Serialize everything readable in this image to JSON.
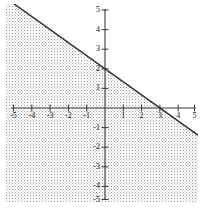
{
  "chart_data": {
    "type": "line",
    "title": "",
    "xlabel": "",
    "ylabel": "",
    "xlim": [
      -5,
      5
    ],
    "ylim": [
      -5,
      5
    ],
    "grid": false,
    "legend": null,
    "x_ticks": [
      -5,
      -4,
      -3,
      -2,
      -1,
      1,
      2,
      3,
      4,
      5
    ],
    "y_ticks": [
      -5,
      -4,
      -3,
      -2,
      -1,
      1,
      2,
      3,
      4,
      5
    ],
    "x_tick_labels": [
      "-5",
      "-4",
      "-3",
      "-2",
      "-1",
      "1",
      "2",
      "3",
      "4",
      "5"
    ],
    "y_tick_labels": [
      "-5",
      "-4",
      "-3",
      "-2",
      "-1",
      "1",
      "2",
      "3",
      "4",
      "5"
    ],
    "series": [
      {
        "name": "boundary-line",
        "type": "line",
        "style": "solid",
        "color": "#2b2b2b",
        "slope": -0.6667,
        "intercept": 2,
        "x_intercept": 3,
        "y_intercept": 2,
        "points": [
          [
            -5.1,
            5.4
          ],
          [
            0,
            2
          ],
          [
            3,
            0
          ],
          [
            4.8,
            -1.2
          ]
        ]
      },
      {
        "name": "shaded-region",
        "type": "area",
        "fill": "stipple-dots",
        "color": "#9a9a9a",
        "description": "region below and including the line"
      }
    ]
  },
  "colors": {
    "axis": "#3a3a3a",
    "line": "#2b2b2b",
    "tick_text": "#111111",
    "shade_dot": "#9d9d9d",
    "background": "#ffffff"
  },
  "axes": {
    "origin_px": [
      105,
      108
    ],
    "unit_x_px": 18.3,
    "unit_y_px": 19.6,
    "tick_length_px": 4
  }
}
